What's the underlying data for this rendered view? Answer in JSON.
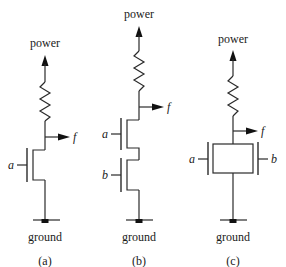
{
  "diagram": {
    "circuits": [
      {
        "id": "a",
        "caption": "(a)",
        "supply_label": "power",
        "ground_label": "ground",
        "output_label": "f",
        "inputs": [
          "a"
        ],
        "topology": "single transistor"
      },
      {
        "id": "b",
        "caption": "(b)",
        "supply_label": "power",
        "ground_label": "ground",
        "output_label": "f",
        "inputs": [
          "a",
          "b"
        ],
        "topology": "series transistors"
      },
      {
        "id": "c",
        "caption": "(c)",
        "supply_label": "power",
        "ground_label": "ground",
        "output_label": "f",
        "inputs": [
          "a",
          "b"
        ],
        "topology": "parallel transistors"
      }
    ],
    "colors": {
      "line": "#2a2a2a",
      "text": "#1a1a1a",
      "background": "#ffffff"
    }
  }
}
